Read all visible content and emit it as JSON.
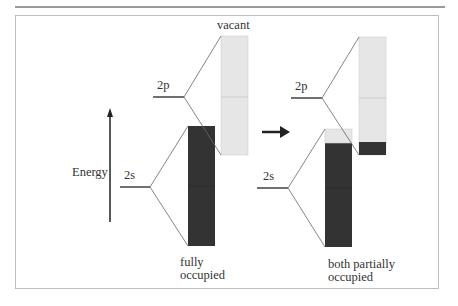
{
  "diagram": {
    "axis": {
      "label": "Energy"
    },
    "left_panel": {
      "levels": [
        {
          "label": "2p"
        },
        {
          "label": "2s"
        }
      ],
      "top_label": "vacant",
      "bottom_label_line1": "fully",
      "bottom_label_line2": "occupied",
      "bands": [
        {
          "name": "2p band",
          "state": "vacant",
          "fill_fraction": 0.0
        },
        {
          "name": "2s band",
          "state": "fully occupied",
          "fill_fraction": 1.0
        }
      ]
    },
    "right_panel": {
      "levels": [
        {
          "label": "2p"
        },
        {
          "label": "2s"
        }
      ],
      "bottom_label_line1": "both partially",
      "bottom_label_line2": "occupied",
      "bands": [
        {
          "name": "2p band",
          "state": "partially occupied",
          "fill_fraction": 0.11
        },
        {
          "name": "2s band",
          "state": "partially occupied",
          "fill_fraction": 0.88
        }
      ]
    },
    "transition_arrow": "right-arrow",
    "colors": {
      "occupied": "#333333",
      "vacant": "#e6e6e6",
      "line": "#555555"
    }
  }
}
